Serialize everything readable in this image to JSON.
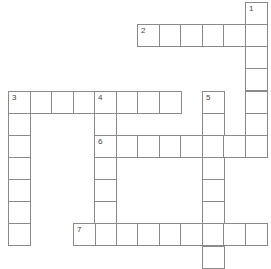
{
  "puzzle": {
    "type": "crossword",
    "cell_size_px": 21.5,
    "origin": {
      "x": 8,
      "y": 2
    },
    "line_color": "#8a8a8a",
    "number_color": "#444444",
    "entries": [
      {
        "number": "1",
        "direction": "down",
        "row": 0,
        "col": 11,
        "length": 7
      },
      {
        "number": "2",
        "direction": "across",
        "row": 1,
        "col": 6,
        "length": 6
      },
      {
        "number": "3",
        "direction": "across",
        "row": 4,
        "col": 0,
        "length": 8
      },
      {
        "number": "3",
        "direction": "down",
        "row": 4,
        "col": 0,
        "length": 7
      },
      {
        "number": "4",
        "direction": "down",
        "row": 4,
        "col": 4,
        "length": 7
      },
      {
        "number": "5",
        "direction": "down",
        "row": 4,
        "col": 9,
        "length": 8
      },
      {
        "number": "6",
        "direction": "across",
        "row": 6,
        "col": 4,
        "length": 8
      },
      {
        "number": "7",
        "direction": "across",
        "row": 10,
        "col": 3,
        "length": 9
      }
    ]
  }
}
